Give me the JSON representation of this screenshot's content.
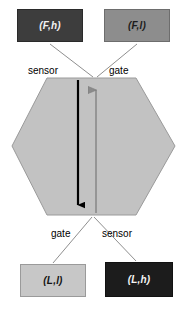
{
  "diagram": {
    "background_color": "#ffffff",
    "hexagon": {
      "fill_color": "#c2c2c2",
      "stroke_color": "#8f8f8f",
      "points": "47,78 136,78 175,146 136,215 47,215 12,146"
    },
    "states": {
      "top_left": {
        "label": "(F,h)",
        "fill_color": "#3d3d3d",
        "text_color": "#f2f2f2"
      },
      "top_right": {
        "label": "(F,l)",
        "fill_color": "#8d8d8d",
        "text_color": "#1c1c1c"
      },
      "bottom_left": {
        "label": "(L,l)",
        "fill_color": "#c7c7c7",
        "text_color": "#141414"
      },
      "bottom_right": {
        "label": "(L,h)",
        "fill_color": "#1c1c1c",
        "text_color": "#f4f4f4"
      }
    },
    "port_labels": {
      "top_left": "sensor",
      "top_right": "gate",
      "bottom_left": "gate",
      "bottom_right": "sensor"
    },
    "arrows": {
      "down": {
        "name": "sensor-arrow-down",
        "color": "#000000",
        "x": 78,
        "y_start": 80,
        "y_end": 214,
        "direction": "down"
      },
      "up": {
        "name": "gate-arrow-up",
        "color": "#8f8f8f",
        "x": 96,
        "y_start": 214,
        "y_end": 80,
        "direction": "up"
      }
    },
    "connectors": {
      "color": "#8f8f8f",
      "top_left_line": "50,44 93,77",
      "top_right_line": "137,44 97,77",
      "bottom_left_line": "92,217 53,263",
      "bottom_right_line": "94,217 136,261"
    }
  }
}
